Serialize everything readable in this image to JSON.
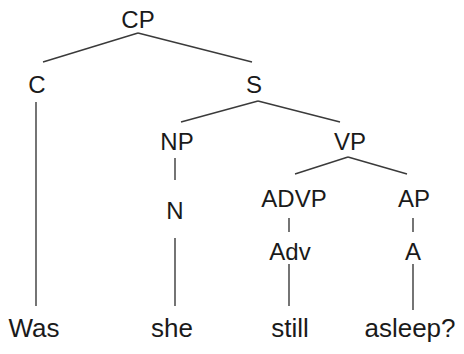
{
  "tree": {
    "nodes": {
      "cp": "CP",
      "c": "C",
      "s": "S",
      "np": "NP",
      "vp": "VP",
      "n": "N",
      "advp": "ADVP",
      "ap": "AP",
      "adv": "Adv",
      "a": "A"
    },
    "words": {
      "was": "Was",
      "she": "she",
      "still": "still",
      "asleep": "asleep?"
    },
    "sentence": "Was she still asleep?",
    "line_color": "#333333"
  }
}
